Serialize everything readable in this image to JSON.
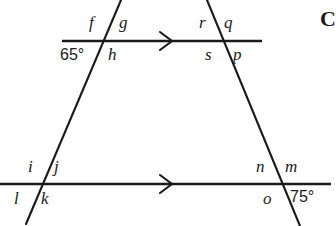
{
  "figure": {
    "type": "geometry-diagram",
    "background_color": "#ffffff",
    "stroke_color": "#1a1a1a"
  },
  "lines": {
    "top_parallel": {
      "name": "top-parallel-line",
      "x1": 62,
      "y1": 41,
      "x2": 262,
      "y2": 41,
      "marker": "single-chevron-arrow",
      "marker_x": 168,
      "marker_y": 41
    },
    "bottom_parallel": {
      "name": "bottom-parallel-line",
      "x1": 0,
      "y1": 184,
      "x2": 331,
      "y2": 184,
      "marker": "single-chevron-arrow",
      "marker_x": 168,
      "marker_y": 184
    },
    "left_transversal": {
      "name": "left-transversal-line",
      "x1": 121,
      "y1": 0,
      "x2": 26,
      "y2": 224
    },
    "right_transversal": {
      "name": "right-transversal-line",
      "x1": 207,
      "y1": 0,
      "x2": 300,
      "y2": 226
    }
  },
  "intersections": [
    {
      "id": "top-left",
      "labels": [
        {
          "key": "f",
          "text": "f",
          "x": 89,
          "y": 14
        },
        {
          "key": "g",
          "text": "g",
          "x": 119,
          "y": 14
        },
        {
          "key": "h",
          "text": "h",
          "x": 108,
          "y": 46
        }
      ],
      "angle": {
        "text": "65°",
        "x": 60,
        "y": 47
      }
    },
    {
      "id": "top-right",
      "labels": [
        {
          "key": "r",
          "text": "r",
          "x": 199,
          "y": 14
        },
        {
          "key": "q",
          "text": "q",
          "x": 224,
          "y": 14
        },
        {
          "key": "s",
          "text": "s",
          "x": 205,
          "y": 46
        },
        {
          "key": "p",
          "text": "p",
          "x": 233,
          "y": 46
        }
      ],
      "angle": null
    },
    {
      "id": "bottom-left",
      "labels": [
        {
          "key": "i",
          "text": "i",
          "x": 28,
          "y": 158
        },
        {
          "key": "j",
          "text": "j",
          "x": 54,
          "y": 158
        },
        {
          "key": "l",
          "text": "l",
          "x": 14,
          "y": 190
        },
        {
          "key": "k",
          "text": "k",
          "x": 41,
          "y": 190
        }
      ],
      "angle": null
    },
    {
      "id": "bottom-right",
      "labels": [
        {
          "key": "n",
          "text": "n",
          "x": 256,
          "y": 158
        },
        {
          "key": "m",
          "text": "m",
          "x": 285,
          "y": 158
        },
        {
          "key": "o",
          "text": "o",
          "x": 263,
          "y": 190
        }
      ],
      "angle": {
        "text": "75°",
        "x": 290,
        "y": 189
      }
    }
  ],
  "corner_mark": {
    "text": "C",
    "x": 320,
    "y": 8
  }
}
